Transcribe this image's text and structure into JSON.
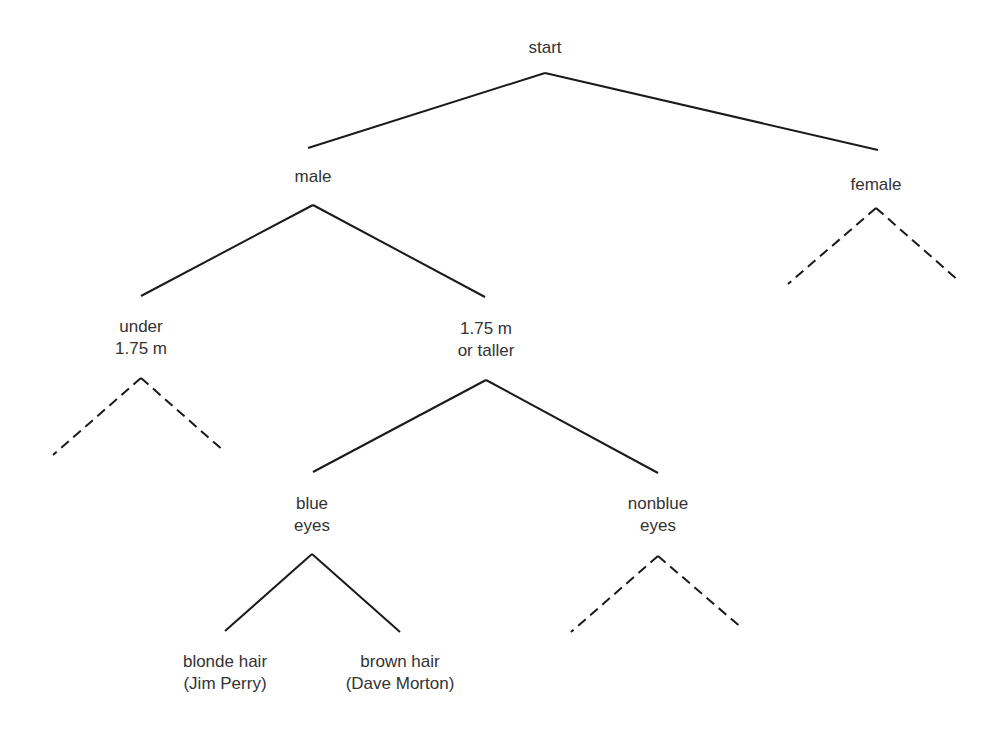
{
  "diagram": {
    "type": "decision-tree",
    "line_color": "#1a1a1a",
    "text_color": "#333333",
    "nodes": {
      "start": {
        "lines": [
          "start"
        ],
        "x": 545,
        "y": 37
      },
      "male": {
        "lines": [
          "male"
        ],
        "x": 313,
        "y": 166
      },
      "female": {
        "lines": [
          "female"
        ],
        "x": 876,
        "y": 174
      },
      "under": {
        "lines": [
          "under",
          "1.75 m"
        ],
        "x": 141,
        "y": 316
      },
      "taller": {
        "lines": [
          "1.75 m",
          "or taller"
        ],
        "x": 486,
        "y": 318
      },
      "blue": {
        "lines": [
          "blue",
          "eyes"
        ],
        "x": 312,
        "y": 493
      },
      "nonblue": {
        "lines": [
          "nonblue",
          "eyes"
        ],
        "x": 658,
        "y": 493
      },
      "blonde": {
        "lines": [
          "blonde hair",
          "(Jim Perry)"
        ],
        "x": 225,
        "y": 651
      },
      "brown": {
        "lines": [
          "brown hair",
          "(Dave Morton)"
        ],
        "x": 400,
        "y": 651
      }
    },
    "edges": [
      {
        "from": "start",
        "x1": 545,
        "y1": 73,
        "x2": 308,
        "y2": 148,
        "style": "solid"
      },
      {
        "from": "start",
        "x1": 545,
        "y1": 73,
        "x2": 878,
        "y2": 150,
        "style": "solid"
      },
      {
        "from": "male",
        "x1": 313,
        "y1": 205,
        "x2": 141,
        "y2": 296,
        "style": "solid"
      },
      {
        "from": "male",
        "x1": 313,
        "y1": 205,
        "x2": 485,
        "y2": 297,
        "style": "solid"
      },
      {
        "from": "female",
        "x1": 876,
        "y1": 208,
        "x2": 788,
        "y2": 284,
        "style": "dashed"
      },
      {
        "from": "female",
        "x1": 876,
        "y1": 208,
        "x2": 959,
        "y2": 281,
        "style": "dashed"
      },
      {
        "from": "under",
        "x1": 141,
        "y1": 378,
        "x2": 53,
        "y2": 455,
        "style": "dashed"
      },
      {
        "from": "under",
        "x1": 141,
        "y1": 378,
        "x2": 225,
        "y2": 452,
        "style": "dashed"
      },
      {
        "from": "taller",
        "x1": 486,
        "y1": 380,
        "x2": 313,
        "y2": 472,
        "style": "solid"
      },
      {
        "from": "taller",
        "x1": 486,
        "y1": 380,
        "x2": 658,
        "y2": 473,
        "style": "solid"
      },
      {
        "from": "blue",
        "x1": 312,
        "y1": 554,
        "x2": 225,
        "y2": 631,
        "style": "solid"
      },
      {
        "from": "blue",
        "x1": 312,
        "y1": 554,
        "x2": 400,
        "y2": 632,
        "style": "solid"
      },
      {
        "from": "nonblue",
        "x1": 658,
        "y1": 556,
        "x2": 571,
        "y2": 632,
        "style": "dashed"
      },
      {
        "from": "nonblue",
        "x1": 658,
        "y1": 556,
        "x2": 743,
        "y2": 629,
        "style": "dashed"
      }
    ]
  }
}
